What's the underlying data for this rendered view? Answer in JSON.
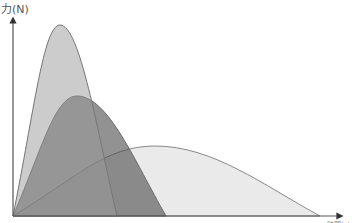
{
  "chart_data": {
    "type": "area",
    "title": "",
    "ylabel": "力(N)",
    "xlabel": "時間(s)",
    "grid": false,
    "legend": null,
    "x_range_px": [
      13,
      330
    ],
    "baseline_y_px": 216,
    "series": [
      {
        "name": "wide-low",
        "description": "broad, low-force curve",
        "start_x": 13,
        "peak_x": 155,
        "peak_y": 146,
        "end_x": 320,
        "fill": "#d8d8d8",
        "opacity": 0.55,
        "stroke": "#888888"
      },
      {
        "name": "medium",
        "description": "medium-duration, medium-force curve",
        "start_x": 13,
        "peak_x": 77,
        "peak_y": 96,
        "end_x": 166,
        "fill": "#4a4a4a",
        "opacity": 0.6,
        "stroke": "#666666"
      },
      {
        "name": "tall-narrow",
        "description": "short-duration, high-force curve",
        "start_x": 13,
        "peak_x": 60,
        "peak_y": 25,
        "end_x": 117,
        "fill": "#9a9a9a",
        "opacity": 0.5,
        "stroke": "#777777"
      }
    ]
  },
  "labels": {
    "y_axis": "力(N)",
    "x_axis": "時間(s)"
  }
}
